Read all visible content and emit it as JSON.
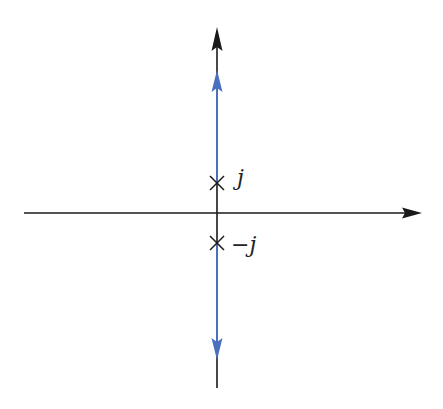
{
  "diagram": {
    "type": "root-locus",
    "colors": {
      "axis": "#1a1a1a",
      "locus": "#4a6fbf",
      "background": "#ffffff"
    },
    "axes": {
      "real_axis": {
        "orientation": "horizontal",
        "arrow": "right"
      },
      "imaginary_axis": {
        "orientation": "vertical",
        "arrow": "up"
      }
    },
    "poles": [
      {
        "label": "j",
        "value": "+j",
        "marker": "×"
      },
      {
        "label": "−j",
        "value": "-j",
        "marker": "×"
      }
    ],
    "locus_branches": [
      {
        "from": "j",
        "direction": "up",
        "arrow": "up"
      },
      {
        "from": "−j",
        "direction": "down",
        "arrow": "down"
      }
    ]
  }
}
